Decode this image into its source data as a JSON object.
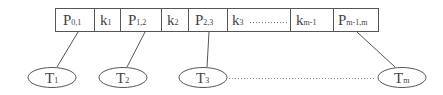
{
  "diagram": {
    "type": "b-tree-node",
    "node_cells": [
      {
        "main": "P",
        "sub": "0,1",
        "kind": "pointer"
      },
      {
        "main": "k",
        "sub": "1",
        "kind": "key"
      },
      {
        "main": "P",
        "sub": "1,2",
        "kind": "pointer"
      },
      {
        "main": "k",
        "sub": "2",
        "kind": "key"
      },
      {
        "main": "P",
        "sub": "2,3",
        "kind": "pointer"
      },
      {
        "main": "k",
        "sub": "3",
        "kind": "key",
        "ellipsis": "··········"
      },
      {
        "main": "k",
        "sub": "m-1",
        "kind": "key"
      },
      {
        "main": "P",
        "sub": "m-1,m",
        "kind": "pointer"
      }
    ],
    "subtrees": [
      {
        "main": "T",
        "sub": "1"
      },
      {
        "main": "T",
        "sub": "2"
      },
      {
        "main": "T",
        "sub": "3"
      },
      {
        "main": "T",
        "sub": "m"
      }
    ],
    "subtree_ellipsis": "dotted",
    "colors": {
      "stroke": "#555555",
      "text": "#444444",
      "background": "#ffffff"
    }
  }
}
